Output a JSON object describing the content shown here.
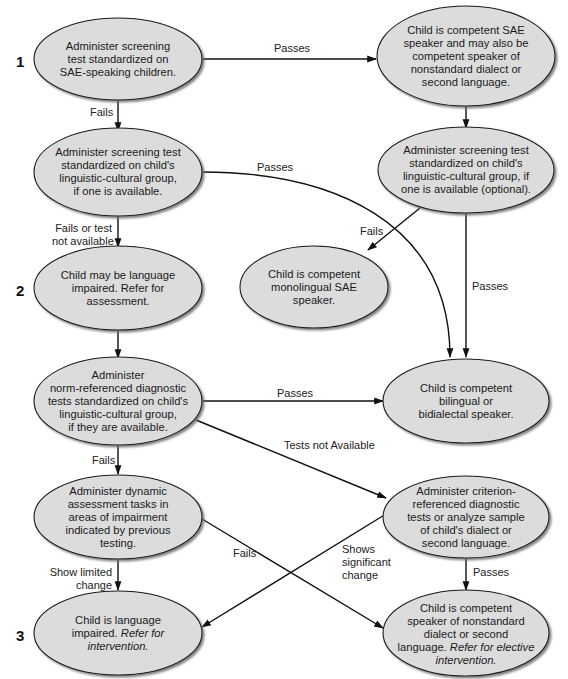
{
  "diagram": {
    "type": "flowchart",
    "colors": {
      "node_fill": "#dcdcdc",
      "node_stroke": "#1a1a1a",
      "edge": "#111111",
      "shadow": "#7a7a7a"
    },
    "levels": [
      {
        "label": "1"
      },
      {
        "label": "2"
      },
      {
        "label": "3"
      }
    ],
    "nodes": [
      {
        "id": "screen_sae",
        "text": "Administer screening test standardized on SAE-speaking children."
      },
      {
        "id": "competent_sae",
        "text": "Child is competent SAE speaker and may also be competent speaker of nonstandard dialect or second language."
      },
      {
        "id": "screen_group",
        "text": "Administer screening test standardized on child's linguistic-cultural group, if one is available."
      },
      {
        "id": "screen_group_optional",
        "text": "Administer screening test standardized on child's linguistic-cultural group, if one is available (optional)."
      },
      {
        "id": "may_be_impaired",
        "text": "Child may be language impaired. Refer for assessment."
      },
      {
        "id": "monolingual_sae",
        "text": "Child is competent monolingual SAE speaker."
      },
      {
        "id": "norm_referenced",
        "text": "Administer norm-referenced diagnostic tests standardized on child's linguistic-cultural group, if they are available."
      },
      {
        "id": "bilingual",
        "text": "Child is competent bilingual or bidialectal speaker."
      },
      {
        "id": "dynamic_assessment",
        "text": "Administer dynamic assessment tasks in areas of impairment indicated by previous testing."
      },
      {
        "id": "criterion_referenced",
        "text": "Administer criterion-referenced diagnostic tests or analyze sample of child's dialect or second language."
      },
      {
        "id": "impaired",
        "text": "Child is language impaired.",
        "italic_text": "Refer for intervention."
      },
      {
        "id": "competent_nonstandard",
        "text": "Child is competent speaker of nonstandard dialect or second language.",
        "italic_text": "Refer for elective intervention."
      }
    ],
    "node_lines": {
      "screen_sae": [
        "Administer screening",
        "test standardized on",
        "SAE-speaking children."
      ],
      "competent_sae": [
        "Child is competent SAE",
        "speaker and may also be",
        "competent speaker of",
        "nonstandard dialect or",
        "second language."
      ],
      "screen_group": [
        "Administer screening test",
        "standardized on child's",
        "linguistic-cultural group,",
        "if one is available."
      ],
      "screen_group_optional": [
        "Administer screening test",
        "standardized on child's",
        "linguistic-cultural group, if",
        "one is available (optional)."
      ],
      "may_be_impaired": [
        "Child may be language",
        "impaired. Refer for",
        "assessment."
      ],
      "monolingual_sae": [
        "Child is competent",
        "monolingual SAE",
        "speaker."
      ],
      "norm_referenced": [
        "Administer",
        "norm-referenced diagnostic",
        "tests standardized on child's",
        "linguistic-cultural group,",
        "if they are available."
      ],
      "bilingual": [
        "Child is competent",
        "bilingual or",
        "bidialectal speaker."
      ],
      "dynamic_assessment": [
        "Administer dynamic",
        "assessment tasks in",
        "areas of impairment",
        "indicated by previous",
        "testing."
      ],
      "criterion_referenced": [
        "Administer criterion-",
        "referenced diagnostic",
        "tests or analyze sample",
        "of child's dialect or",
        "second language."
      ],
      "impaired": [
        "Child is language",
        "impaired.",
        "Refer for",
        "intervention."
      ],
      "competent_nonstandard": [
        "Child is competent",
        "speaker of nonstandard",
        "dialect or second",
        "language.",
        "Refer for elective",
        "intervention."
      ]
    },
    "edges": [
      {
        "from": "screen_sae",
        "to": "competent_sae",
        "label": "Passes"
      },
      {
        "from": "screen_sae",
        "to": "screen_group",
        "label": "Fails"
      },
      {
        "from": "competent_sae",
        "to": "screen_group_optional",
        "label": ""
      },
      {
        "from": "screen_group",
        "to": "bilingual",
        "label": "Passes"
      },
      {
        "from": "screen_group",
        "to": "may_be_impaired",
        "label_lines": [
          "Fails or test",
          "not available"
        ]
      },
      {
        "from": "screen_group_optional",
        "to": "monolingual_sae",
        "label": "Fails"
      },
      {
        "from": "screen_group_optional",
        "to": "bilingual",
        "label": "Passes"
      },
      {
        "from": "may_be_impaired",
        "to": "norm_referenced",
        "label": ""
      },
      {
        "from": "norm_referenced",
        "to": "bilingual",
        "label": "Passes"
      },
      {
        "from": "norm_referenced",
        "to": "criterion_referenced",
        "label": "Tests not Available"
      },
      {
        "from": "norm_referenced",
        "to": "dynamic_assessment",
        "label": "Fails"
      },
      {
        "from": "dynamic_assessment",
        "to": "impaired",
        "label_lines": [
          "Show limited",
          "change"
        ]
      },
      {
        "from": "dynamic_assessment",
        "to": "competent_nonstandard",
        "label_lines": [
          "Shows",
          "significant",
          "change"
        ]
      },
      {
        "from": "criterion_referenced",
        "to": "impaired",
        "label": "Fails"
      },
      {
        "from": "criterion_referenced",
        "to": "competent_nonstandard",
        "label": "Passes"
      }
    ]
  }
}
